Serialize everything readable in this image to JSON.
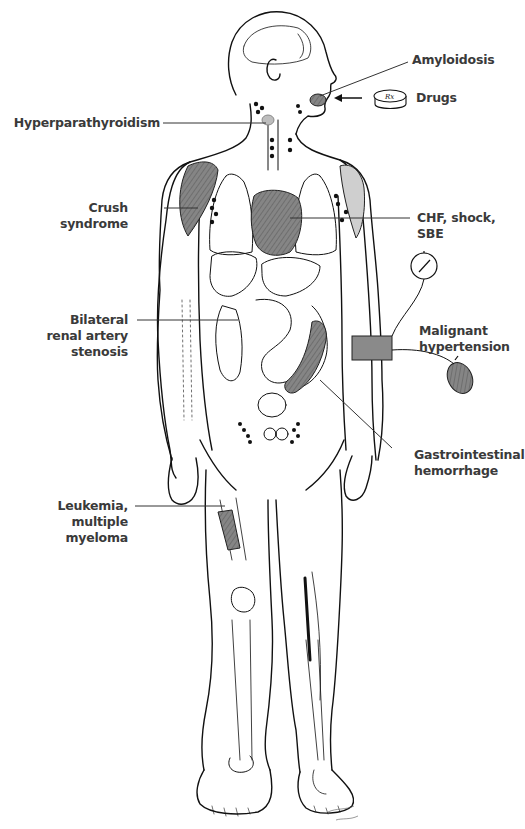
{
  "diagram": {
    "colors": {
      "ink": "#111111",
      "label_text": "#3a3a3a",
      "shading": "#7d7d7d",
      "background": "#ffffff"
    },
    "labels": {
      "amyloidosis": {
        "lines": [
          "Amyloidosis"
        ]
      },
      "drugs": {
        "lines": [
          "Drugs"
        ]
      },
      "hyperparathyroidism": {
        "lines": [
          "Hyperparathyroidism"
        ]
      },
      "crush_syndrome": {
        "lines": [
          "Crush",
          "syndrome"
        ]
      },
      "chf": {
        "lines": [
          "CHF, shock,",
          "SBE"
        ]
      },
      "renal_artery": {
        "lines": [
          "Bilateral",
          "renal artery",
          "stenosis"
        ]
      },
      "hypertension": {
        "lines": [
          "Malignant",
          "hypertension"
        ]
      },
      "gi_hemorrhage": {
        "lines": [
          "Gastrointestinal",
          "hemorrhage"
        ]
      },
      "leukemia": {
        "lines": [
          "Leukemia,",
          "multiple",
          "myeloma"
        ]
      }
    },
    "pill_text": "Rx",
    "artist_signature": "signature (illegible)"
  }
}
